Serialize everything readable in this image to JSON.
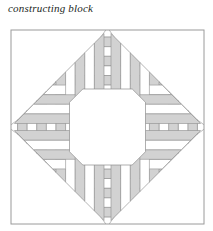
{
  "caption": {
    "text": "constructing block"
  },
  "figure": {
    "name": "pineapple-quilt-block",
    "title": "constructing block",
    "frame": {
      "x": 11,
      "y": 30,
      "width": 193,
      "height": 194
    },
    "center": {
      "cx": 107.5,
      "cy": 127,
      "octagon_radius": 38
    },
    "colors": {
      "background": "#ffffff",
      "shade": "#d2d2d2",
      "shade_alt": "#c9c9c9",
      "line": "#8d8d8d",
      "frame_line": "#9a9a9a",
      "caption": "#221f1d"
    },
    "geometry": {
      "rings": 10,
      "ring_pitch": 9.6,
      "corner_strip_count": 4,
      "symmetry": "4-fold mirror (top/bottom/left/right)"
    },
    "rings": [
      {
        "index": 0,
        "offset": 3.5,
        "filled": true
      },
      {
        "index": 1,
        "offset": 13.1,
        "filled": false
      },
      {
        "index": 2,
        "offset": 22.7,
        "filled": true
      },
      {
        "index": 3,
        "offset": 32.3,
        "filled": false
      },
      {
        "index": 4,
        "offset": 41.9,
        "filled": true
      },
      {
        "index": 5,
        "offset": 51.5,
        "filled": false
      },
      {
        "index": 6,
        "offset": 61.1,
        "filled": true
      },
      {
        "index": 7,
        "offset": 70.7,
        "filled": false
      },
      {
        "index": 8,
        "offset": 80.3,
        "filled": true
      },
      {
        "index": 9,
        "offset": 89.9,
        "filled": false
      }
    ],
    "labels": {
      "center_patch": "center octagon",
      "corner_patch": "corner diagonal strips",
      "band_patch": "trapezoid log strip"
    }
  }
}
